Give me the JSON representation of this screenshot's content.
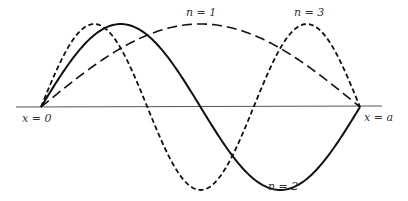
{
  "diagram": {
    "axis": {
      "x_start": 16,
      "x_end": 382,
      "y": 107,
      "color": "#555555"
    },
    "box": {
      "x0_px": 41,
      "xa_px": 360,
      "baseline_px": 107,
      "amplitude_px": 83
    },
    "labels": {
      "x0": "x = 0",
      "xa": "x = a",
      "n1": "n = 1",
      "n2": "n = 2",
      "n3": "n = 3"
    },
    "modes": [
      {
        "n": 1,
        "style": "long-dash",
        "dash": "10 5",
        "width": 1.6
      },
      {
        "n": 2,
        "style": "solid",
        "dash": "",
        "width": 2.0
      },
      {
        "n": 3,
        "style": "short-dash",
        "dash": "5 3",
        "width": 1.8
      }
    ],
    "stroke_color": "#111111"
  }
}
